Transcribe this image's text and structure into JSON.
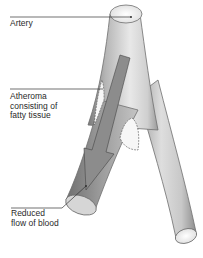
{
  "diagram": {
    "labels": [
      {
        "id": "artery",
        "text": "Artery"
      },
      {
        "id": "atheroma",
        "text": "Atheroma\nconsisting of\nfatty tissue"
      },
      {
        "id": "flow",
        "text": "Reduced\nflow of blood"
      }
    ],
    "colors": {
      "vessel_outline": "#6e6e6e",
      "vessel_fill_light": "#f2f2f2",
      "vessel_fill_dark": "#8a8a8a",
      "arrow_fill": "#8c8c8c",
      "plaque_fill": "#f7f7f7",
      "leader_line": "#333333"
    }
  }
}
